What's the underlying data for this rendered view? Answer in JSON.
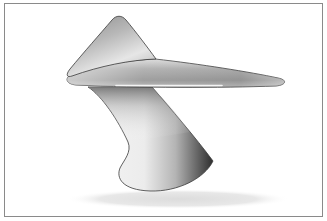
{
  "figure": {
    "description": "Abstract 3D-rendered sculpture: a triangular fin and long tapered wing balanced on a curved twisting stem, casting a soft shadow",
    "colors": {
      "frame_border": "#8a8a8a",
      "background": "#ffffff",
      "outline": "#3a3a3a",
      "highlight_line": "#f2f2f2",
      "shadow": "#e4e4e4"
    }
  }
}
